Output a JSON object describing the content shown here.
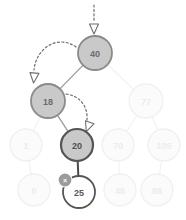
{
  "diagram": {
    "colors": {
      "active_fill": "#c9c9c9",
      "active_stroke": "#8a8a8a",
      "current_stroke": "#555555",
      "faded_fill": "#fbfbfb",
      "faded_stroke": "#f0f0f0",
      "faded_text": "#ececec",
      "active_text": "#6b6b6b",
      "edge_faded": "#f1f1f1",
      "edge_active": "#9a9a9a",
      "edge_current": "#4a4a4a",
      "arrow_color": "#6e6e6e",
      "badge_fill": "#9b9b9b",
      "node_white_fill": "#ffffff",
      "background": "#ffffff"
    },
    "nodes": [
      {
        "id": "n40",
        "label": "40",
        "cx": 95,
        "cy": 53,
        "r": 17,
        "state": "active"
      },
      {
        "id": "n18",
        "label": "18",
        "cx": 48,
        "cy": 101,
        "r": 17,
        "state": "active"
      },
      {
        "id": "n77",
        "label": "77",
        "cx": 146,
        "cy": 101,
        "r": 17,
        "state": "faded"
      },
      {
        "id": "n1",
        "label": "1",
        "cx": 26,
        "cy": 145,
        "r": 16,
        "state": "faded"
      },
      {
        "id": "n20",
        "label": "20",
        "cx": 77,
        "cy": 145,
        "r": 16,
        "state": "current"
      },
      {
        "id": "n70",
        "label": "70",
        "cx": 118,
        "cy": 145,
        "r": 16,
        "state": "faded"
      },
      {
        "id": "n105",
        "label": "105",
        "cx": 164,
        "cy": 145,
        "r": 16,
        "state": "faded"
      },
      {
        "id": "n0",
        "label": "0",
        "cx": 34,
        "cy": 190,
        "r": 16,
        "state": "faded"
      },
      {
        "id": "n25",
        "label": "25",
        "cx": 79,
        "cy": 192,
        "r": 16,
        "state": "target"
      },
      {
        "id": "n45",
        "label": "45",
        "cx": 120,
        "cy": 190,
        "r": 16,
        "state": "faded"
      },
      {
        "id": "n88",
        "label": "88",
        "cx": 157,
        "cy": 190,
        "r": 16,
        "state": "faded"
      }
    ],
    "edges": [
      {
        "from": "n40",
        "to": "n18",
        "state": "active"
      },
      {
        "from": "n40",
        "to": "n77",
        "state": "faded"
      },
      {
        "from": "n18",
        "to": "n1",
        "state": "faded"
      },
      {
        "from": "n18",
        "to": "n20",
        "state": "active"
      },
      {
        "from": "n77",
        "to": "n70",
        "state": "faded"
      },
      {
        "from": "n77",
        "to": "n105",
        "state": "faded"
      },
      {
        "from": "n1",
        "to": "n0",
        "state": "faded"
      },
      {
        "from": "n20",
        "to": "n25",
        "state": "current"
      },
      {
        "from": "n70",
        "to": "n45",
        "state": "faded"
      },
      {
        "from": "n105",
        "to": "n88",
        "state": "faded"
      }
    ],
    "arrows": [
      {
        "id": "arrow-entry",
        "kind": "straight-dashed-down",
        "description": "entry pointer into root node 40",
        "path": "M 94 5 L 94 22",
        "head": {
          "x": 94,
          "y": 29,
          "rotate": 90
        }
      },
      {
        "id": "arrow-root-to-left",
        "kind": "curved-dashed",
        "description": "comparison step from node 40 to node 18",
        "path": "M 76 47 C 58 34, 36 48, 34 70",
        "head": {
          "x": 34,
          "y": 78,
          "rotate": 95
        }
      },
      {
        "id": "arrow-left-to-right-child",
        "kind": "curved-dashed",
        "description": "comparison step from node 18 to node 20",
        "path": "M 66 94 C 80 96, 88 106, 87 120",
        "head": {
          "x": 88,
          "y": 127,
          "rotate": 110
        }
      }
    ],
    "badges": [
      {
        "id": "delete-badge",
        "icon": "close-x-icon",
        "label": "×",
        "attached_to": "n25",
        "cx": 65,
        "cy": 180,
        "r": 7,
        "description": "deletion marker on node 25"
      }
    ]
  }
}
